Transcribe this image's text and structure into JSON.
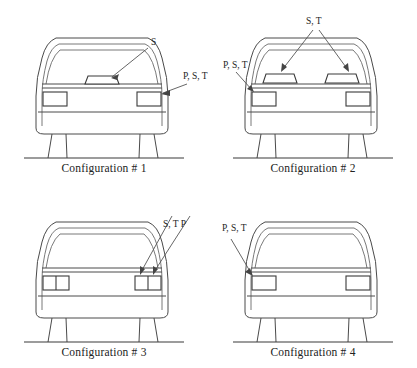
{
  "figure": {
    "background_color": "#ffffff",
    "line_color": "#4a4a4a",
    "label_color": "#1e1e1e",
    "view": "rear view of hatchback automobile",
    "lamp_code_legend": {
      "P": "P",
      "S": "S",
      "T": "T"
    }
  },
  "panels": [
    {
      "id": "configuration-1",
      "caption": "Configuration # 1",
      "labels": [
        {
          "name": "center-high-mount-lamp-label",
          "text": "S",
          "x": 151,
          "y": 45
        },
        {
          "name": "rear-combination-lamp-label",
          "text": "P, S, T",
          "x": 183,
          "y": 79
        }
      ],
      "lamps": [
        {
          "name": "center-high-mount-stop-lamp",
          "type": "trapezoid",
          "codes": "S"
        },
        {
          "name": "left-tail-lamp",
          "type": "box",
          "codes": "P, S, T"
        },
        {
          "name": "right-tail-lamp",
          "type": "box",
          "codes": "P, S, T"
        }
      ]
    },
    {
      "id": "configuration-2",
      "caption": "Configuration # 2",
      "labels": [
        {
          "name": "ledge-lamps-label",
          "text": "S, T",
          "x": 310,
          "y": 23
        },
        {
          "name": "rear-combination-lamp-label",
          "text": "P, S, T",
          "x": 228,
          "y": 68
        }
      ],
      "lamps": [
        {
          "name": "left-ledge-lamp",
          "type": "trapezoid",
          "codes": "S, T"
        },
        {
          "name": "right-ledge-lamp",
          "type": "trapezoid",
          "codes": "S, T"
        },
        {
          "name": "left-tail-lamp",
          "type": "box",
          "codes": "P, S, T"
        },
        {
          "name": "right-tail-lamp",
          "type": "box",
          "codes": "P, S, T"
        }
      ]
    },
    {
      "id": "configuration-3",
      "caption": "Configuration # 3",
      "labels": [
        {
          "name": "split-lamp-label",
          "text": "S, T  P",
          "x": 172,
          "y": 227
        }
      ],
      "lamps": [
        {
          "name": "left-split-tail-lamp",
          "type": "split-box",
          "codes": "S, T  P"
        },
        {
          "name": "right-split-tail-lamp",
          "type": "split-box",
          "codes": "S, T  P"
        }
      ]
    },
    {
      "id": "configuration-4",
      "caption": "Configuration # 4",
      "labels": [
        {
          "name": "rear-combination-lamp-label",
          "text": "P, S, T",
          "x": 222,
          "y": 231
        }
      ],
      "lamps": [
        {
          "name": "left-tail-lamp",
          "type": "box",
          "codes": "P, S, T"
        },
        {
          "name": "right-tail-lamp",
          "type": "box",
          "codes": "P, S, T"
        }
      ]
    }
  ]
}
